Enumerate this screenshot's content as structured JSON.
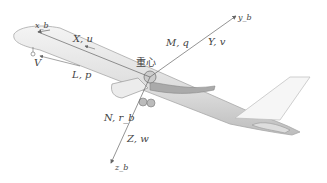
{
  "diagram": {
    "labels": {
      "xb": "x_b",
      "x_u": "X, u",
      "V": "V",
      "L_p": "L, p",
      "M_q": "M, q",
      "Y_v": "Y, v",
      "yb": "y_b",
      "cg": "重心",
      "N_r": "N, r_b",
      "Z_w": "Z, w",
      "zb": "z_b"
    },
    "colors": {
      "line": "#666666",
      "text": "#444444",
      "fuselage": "#e2e2e2",
      "outline": "#9a9a9a"
    }
  }
}
